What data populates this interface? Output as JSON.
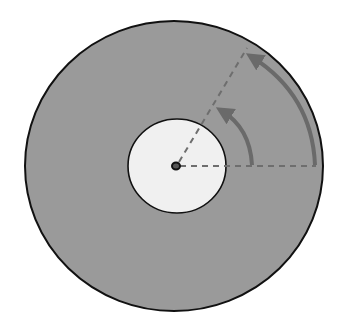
{
  "diagram": {
    "type": "rotating-disk-angular-displacement",
    "colors": {
      "background": "#ffffff",
      "disk_fill": "#9a9a9a",
      "disk_outline": "#111111",
      "label_area_fill": "#f0f0f0",
      "spindle": "#111111",
      "reference_line": "#6e6e6e",
      "arc_arrow": "#6a6a6a"
    },
    "disk": {
      "cx": 174,
      "cy": 166,
      "rx": 149,
      "ry": 145
    },
    "label_area": {
      "cx": 177,
      "cy": 166,
      "rx": 49,
      "ry": 47
    },
    "spindle": {
      "cx": 176,
      "cy": 166,
      "r": 4
    },
    "reference_line": {
      "x1": 180,
      "y1": 166,
      "x2": 316,
      "y2": 166
    },
    "rotated_line": {
      "x1": 179,
      "y1": 162,
      "x2": 247,
      "y2": 48
    },
    "arrows": [
      {
        "name": "inner-arc-arrow",
        "path": "M 252 165 Q 250 128 222 111"
      },
      {
        "name": "outer-arc-arrow",
        "path": "M 315 165 Q 312 95 252 57"
      }
    ]
  }
}
